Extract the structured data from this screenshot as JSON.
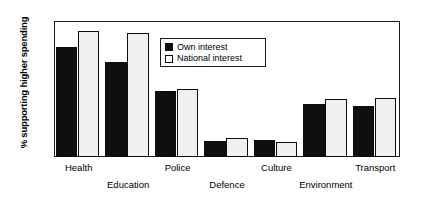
{
  "chart_data": {
    "type": "bar",
    "title": "",
    "xlabel": "",
    "ylabel": "% supporting higher spending",
    "ylim": [
      0,
      80
    ],
    "yticks": [
      0,
      10,
      20,
      30,
      40,
      50,
      60,
      70,
      80
    ],
    "grid": false,
    "legend_position": "inside-top-center",
    "categories": [
      "Health",
      "Education",
      "Police",
      "Defence",
      "Culture",
      "Environment",
      "Transport"
    ],
    "series": [
      {
        "name": "Own interest",
        "color": "#100f0f",
        "values": [
          65,
          56,
          39,
          9.5,
          10,
          31,
          30
        ]
      },
      {
        "name": "National interest",
        "color": "#f0f0f0",
        "values": [
          74,
          73,
          40,
          11,
          9,
          34,
          35
        ]
      }
    ]
  },
  "axis": {
    "y_title": "% supporting higher spending",
    "y_tick_labels": [
      "0",
      "10",
      "20",
      "30",
      "40",
      "50",
      "60",
      "70",
      "80"
    ]
  },
  "legend": {
    "items": [
      {
        "label": "Own interest",
        "swatch": "filled-black-square"
      },
      {
        "label": "National interest",
        "swatch": "open-white-square"
      }
    ]
  }
}
